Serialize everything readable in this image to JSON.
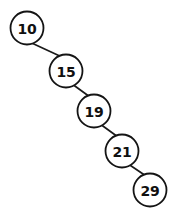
{
  "diagram": {
    "kind": "binary-search-tree",
    "canvas": {
      "width": 188,
      "height": 217,
      "background": "#ffffff"
    },
    "style": {
      "node_fill": "#ffffff",
      "node_stroke": "#141414",
      "node_stroke_width": 1.8,
      "node_radius": 16.5,
      "label_color": "#101010",
      "label_font_size": 14,
      "edge_color": "#1a1a1a",
      "edge_width": 1.7
    },
    "nodes": [
      {
        "id": "n10",
        "label": "10",
        "cx": 27,
        "cy": 28,
        "r": 16.5
      },
      {
        "id": "n15",
        "label": "15",
        "cx": 66,
        "cy": 71,
        "r": 16.5
      },
      {
        "id": "n19",
        "label": "19",
        "cx": 94,
        "cy": 111,
        "r": 16.5
      },
      {
        "id": "n21",
        "label": "21",
        "cx": 122,
        "cy": 151,
        "r": 16.5
      },
      {
        "id": "n29",
        "label": "29",
        "cx": 150,
        "cy": 190,
        "r": 16.5
      }
    ],
    "edges": [
      {
        "id": "e10-15",
        "from": "n10",
        "to": "n15",
        "x1": 29.5,
        "y1": 42.0,
        "x2": 63.0,
        "y2": 57.5
      },
      {
        "id": "e15-19",
        "from": "n15",
        "to": "n19",
        "x1": 73.5,
        "y1": 85.0,
        "x2": 90.0,
        "y2": 97.0
      },
      {
        "id": "e19-21",
        "from": "n19",
        "to": "n21",
        "x1": 101.5,
        "y1": 125.0,
        "x2": 118.0,
        "y2": 137.0
      },
      {
        "id": "e21-29",
        "from": "n21",
        "to": "n29",
        "x1": 129.0,
        "y1": 164.5,
        "x2": 146.0,
        "y2": 176.0
      }
    ]
  }
}
